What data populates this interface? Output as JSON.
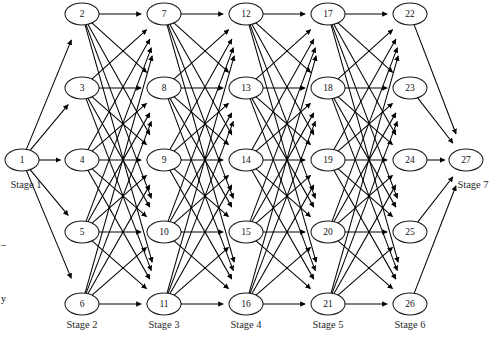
{
  "figure": {
    "type": "layered-network-diagram",
    "title": "",
    "width": 491,
    "height": 338,
    "background_color": "#ffffff",
    "node_fill": "#ffffff",
    "node_stroke": "#1a1a1a",
    "edge_color": "#000000"
  },
  "geometry": {
    "node_rx": 17,
    "node_ry": 11,
    "columns_x": [
      22,
      82,
      164,
      246,
      328,
      410,
      466
    ],
    "rows_y": [
      14,
      88,
      160,
      232,
      304
    ]
  },
  "stages": [
    {
      "id": "stage-1",
      "label": "Stage 1",
      "label_x": 26,
      "label_y": 186,
      "label_anchor": "middle",
      "column_x": 22,
      "nodes": [
        {
          "id": 1,
          "label": "1",
          "x": 22,
          "y": 160
        }
      ]
    },
    {
      "id": "stage-2",
      "label": "Stage 2",
      "label_x": 82,
      "label_y": 326,
      "label_anchor": "middle",
      "column_x": 82,
      "nodes": [
        {
          "id": 2,
          "label": "2",
          "x": 82,
          "y": 14
        },
        {
          "id": 3,
          "label": "3",
          "x": 82,
          "y": 88
        },
        {
          "id": 4,
          "label": "4",
          "x": 82,
          "y": 160
        },
        {
          "id": 5,
          "label": "5",
          "x": 82,
          "y": 232
        },
        {
          "id": 6,
          "label": "6",
          "x": 82,
          "y": 304
        }
      ]
    },
    {
      "id": "stage-3",
      "label": "Stage 3",
      "label_x": 164,
      "label_y": 326,
      "label_anchor": "middle",
      "column_x": 164,
      "nodes": [
        {
          "id": 7,
          "label": "7",
          "x": 164,
          "y": 14
        },
        {
          "id": 8,
          "label": "8",
          "x": 164,
          "y": 88
        },
        {
          "id": 9,
          "label": "9",
          "x": 164,
          "y": 160
        },
        {
          "id": 10,
          "label": "10",
          "x": 164,
          "y": 232
        },
        {
          "id": 11,
          "label": "11",
          "x": 164,
          "y": 304
        }
      ]
    },
    {
      "id": "stage-4",
      "label": "Stage 4",
      "label_x": 246,
      "label_y": 326,
      "label_anchor": "middle",
      "column_x": 246,
      "nodes": [
        {
          "id": 12,
          "label": "12",
          "x": 246,
          "y": 14
        },
        {
          "id": 13,
          "label": "13",
          "x": 246,
          "y": 88
        },
        {
          "id": 14,
          "label": "14",
          "x": 246,
          "y": 160
        },
        {
          "id": 15,
          "label": "15",
          "x": 246,
          "y": 232
        },
        {
          "id": 16,
          "label": "16",
          "x": 246,
          "y": 304
        }
      ]
    },
    {
      "id": "stage-5",
      "label": "Stage 5",
      "label_x": 328,
      "label_y": 326,
      "label_anchor": "middle",
      "column_x": 328,
      "nodes": [
        {
          "id": 17,
          "label": "17",
          "x": 328,
          "y": 14
        },
        {
          "id": 18,
          "label": "18",
          "x": 328,
          "y": 88
        },
        {
          "id": 19,
          "label": "19",
          "x": 328,
          "y": 160
        },
        {
          "id": 20,
          "label": "20",
          "x": 328,
          "y": 232
        },
        {
          "id": 21,
          "label": "21",
          "x": 328,
          "y": 304
        }
      ]
    },
    {
      "id": "stage-6",
      "label": "Stage 6",
      "label_x": 410,
      "label_y": 326,
      "label_anchor": "middle",
      "column_x": 410,
      "nodes": [
        {
          "id": 22,
          "label": "22",
          "x": 410,
          "y": 14
        },
        {
          "id": 23,
          "label": "23",
          "x": 410,
          "y": 88
        },
        {
          "id": 24,
          "label": "24",
          "x": 410,
          "y": 160
        },
        {
          "id": 25,
          "label": "25",
          "x": 410,
          "y": 232
        },
        {
          "id": 26,
          "label": "26",
          "x": 410,
          "y": 304
        }
      ]
    },
    {
      "id": "stage-7",
      "label": "Stage 7",
      "label_x": 473,
      "label_y": 186,
      "label_anchor": "middle",
      "column_x": 466,
      "nodes": [
        {
          "id": 27,
          "label": "27",
          "x": 466,
          "y": 160
        }
      ]
    }
  ],
  "connectivity": {
    "description": "complete bipartite between consecutive stages",
    "directed": true,
    "arrowheads": true
  },
  "margin_marks": [
    {
      "id": "margin-dash",
      "text": "–",
      "x": 1,
      "y": 246
    },
    {
      "id": "margin-glyph",
      "text": "y",
      "x": 1,
      "y": 300
    }
  ]
}
